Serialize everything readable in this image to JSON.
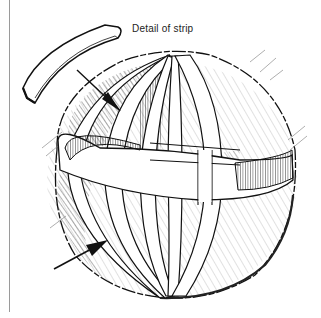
{
  "figure": {
    "label": "Detail of strip",
    "parts": [
      "detached-strip-detail",
      "meridian-strips",
      "equator-band",
      "pointer-arrow-upper",
      "pointer-arrow-lower"
    ],
    "colors": {
      "ink": "#111111",
      "hatch": "#444444",
      "rule": "#9a9a9a",
      "background": "#ffffff"
    }
  }
}
